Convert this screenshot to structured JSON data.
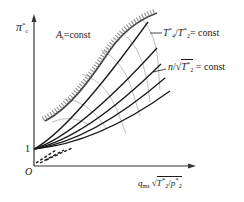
{
  "diagram": {
    "y_axis": {
      "symbol": "π",
      "superscript": "*",
      "subscript": "c",
      "origin_tick": "1"
    },
    "x_axis": {
      "q": "q",
      "q_sub": "ms",
      "radicand_num": "T",
      "radicand_num_sup": "*",
      "radicand_num_sub": "2",
      "slash": "/",
      "denom": "p",
      "denom_sup": "*",
      "denom_sub": "2"
    },
    "origin_label": "O",
    "surge_label": {
      "symbol": "A",
      "sub": "t",
      "rest": "=const"
    },
    "temp_ratio_label": {
      "num": "T",
      "num_sup": "*",
      "num_sub": "4",
      "slash": "/",
      "den": "T",
      "den_sup": "*",
      "den_sub": "2",
      "rest": "= const"
    },
    "speed_label": {
      "n": "n",
      "slash": "/",
      "radicand": "T",
      "radicand_sup": "*",
      "radicand_sub": "2",
      "rest": " = const"
    },
    "colors": {
      "line": "#1a1a1a",
      "surge_hatch": "#8a8a8a",
      "speed_lines": "#b8b8b8"
    },
    "series": {
      "solid_line_count": 5,
      "speed_line_count": 6
    }
  }
}
